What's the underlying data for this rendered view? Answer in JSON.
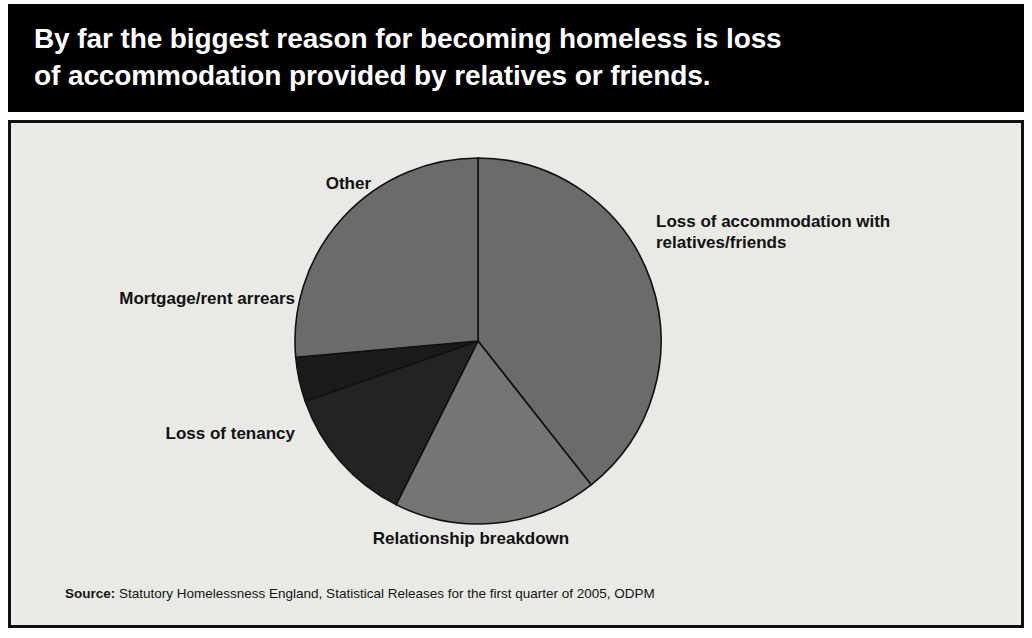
{
  "title": "By far the biggest reason for becoming homeless is loss\nof accommodation provided by relatives or friends.",
  "source": {
    "label": "Source:",
    "text": " Statutory Homelessness England, Statistical Releases for the first quarter of 2005, ODPM"
  },
  "colors": {
    "banner_background": "#000000",
    "banner_text": "#ffffff",
    "panel_background": "#e9e9e6",
    "panel_border": "#101010",
    "slice_outline": "#111111",
    "label_text": "#111111"
  },
  "chart_data": {
    "type": "pie",
    "labels": [
      "Loss of accommodation with\nrelatives/friends",
      "Relationship breakdown",
      "Loss of tenancy",
      "Mortgage/rent arrears",
      "Other"
    ],
    "values": [
      39.4,
      18.0,
      12.3,
      3.9,
      26.4
    ],
    "units": "percent",
    "start_angle_deg": 0,
    "direction": "clockwise",
    "slice_angles_deg": [
      141.8,
      64.8,
      44.2,
      14.1,
      95.1
    ],
    "slice_colors": [
      "#6b6b6b",
      "#757575",
      "#232323",
      "#1b1b1b",
      "#6b6b6b"
    ],
    "legend": "none",
    "labels_position": "outside",
    "grid": false,
    "annotations": []
  },
  "pie_geometry": {
    "center_x": 467,
    "center_y": 218,
    "radius": 183
  }
}
